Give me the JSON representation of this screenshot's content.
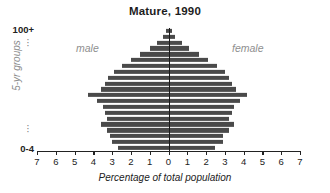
{
  "chart_data": {
    "type": "bar",
    "subtype": "population-pyramid",
    "title": "Mature, 1990",
    "xlabel": "Percentage of total population",
    "ylabel": "5-yr groups",
    "xlim": [
      -7,
      7
    ],
    "xticks": [
      7,
      6,
      5,
      4,
      3,
      2,
      1,
      0,
      1,
      2,
      3,
      4,
      5,
      6,
      7
    ],
    "grid": false,
    "legend_position": "inside-top",
    "bar_color": "#4a4a4a",
    "categories": [
      "0-4",
      "5-9",
      "10-14",
      "15-19",
      "20-24",
      "25-29",
      "30-34",
      "35-39",
      "40-44",
      "45-49",
      "50-54",
      "55-59",
      "60-64",
      "65-69",
      "70-74",
      "75-79",
      "80-84",
      "85-89",
      "90-94",
      "95-99",
      "100+"
    ],
    "series": [
      {
        "name": "male",
        "side": "left",
        "values": [
          2.7,
          3.0,
          3.1,
          3.3,
          3.6,
          3.3,
          3.4,
          3.5,
          3.8,
          4.3,
          3.6,
          3.4,
          3.2,
          2.9,
          2.5,
          2.0,
          1.5,
          1.0,
          0.6,
          0.3,
          0.15
        ]
      },
      {
        "name": "female",
        "side": "right",
        "values": [
          2.5,
          2.9,
          2.9,
          3.2,
          3.5,
          3.2,
          3.4,
          3.5,
          3.8,
          4.2,
          3.6,
          3.4,
          3.2,
          3.0,
          2.6,
          2.1,
          1.6,
          1.1,
          0.7,
          0.35,
          0.2
        ]
      }
    ],
    "annotations": [
      {
        "text": "male",
        "position": "upper-left"
      },
      {
        "text": "female",
        "position": "upper-right"
      }
    ],
    "axis_top_label": "100+",
    "axis_bottom_label": "0-4",
    "axis_ellipsis": "⋮"
  },
  "chart": {
    "title": "Mature, 1990",
    "x_axis_title": "Percentage of total population",
    "y_axis_title": "5-yr groups",
    "y_top_label": "100+",
    "y_bottom_label": "0-4",
    "label_male": "male",
    "label_female": "female",
    "ellipsis_dots": [
      "·",
      "·",
      "·"
    ]
  }
}
